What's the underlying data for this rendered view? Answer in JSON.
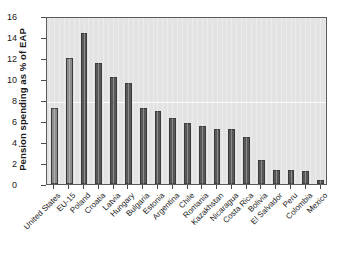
{
  "chart_data": {
    "type": "bar",
    "title": "",
    "xlabel": "",
    "ylabel": "Pension spending as % of EAP",
    "ylim": [
      0,
      16
    ],
    "yticks": [
      0,
      2,
      4,
      6,
      8,
      10,
      12,
      14,
      16
    ],
    "grid": false,
    "legend": "none",
    "categories": [
      "United States",
      "EU-15",
      "Poland",
      "Croatia",
      "Latvia",
      "Hungary",
      "Bulgaria",
      "Estonia",
      "Argentina",
      "Chile",
      "Romania",
      "Kazakhstan",
      "Nicaragua",
      "Costa Rica",
      "Bolivia",
      "El Salvador",
      "Peru",
      "Colombia",
      "Mexico"
    ],
    "values": [
      7.2,
      12.0,
      14.4,
      11.5,
      10.2,
      9.6,
      7.2,
      7.0,
      6.3,
      5.8,
      5.5,
      5.2,
      5.2,
      4.5,
      2.3,
      1.3,
      1.3,
      1.2,
      0.4
    ],
    "bar_colors": [
      "#8c8c8c",
      "#8c8c8c",
      "#585858",
      "#585858",
      "#585858",
      "#585858",
      "#585858",
      "#585858",
      "#585858",
      "#585858",
      "#585858",
      "#585858",
      "#585858",
      "#585858",
      "#585858",
      "#585858",
      "#585858",
      "#585858",
      "#585858"
    ],
    "plot_background": "#e3e3e3",
    "axis_color": "#5a5a5a",
    "reference_line": 8
  }
}
